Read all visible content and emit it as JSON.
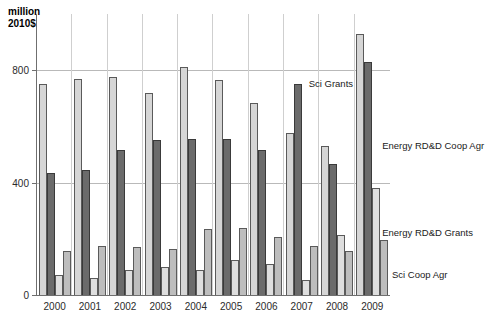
{
  "chart_data": {
    "type": "bar",
    "title": "",
    "subtitle": "",
    "axis_title": "million\n2010$",
    "xlabel": "",
    "ylabel": "million 2010$",
    "ylim": [
      0,
      1000
    ],
    "yticks": [
      0,
      400,
      800
    ],
    "ytick_labels": [
      "0",
      "400",
      "800"
    ],
    "grid": true,
    "legend_position": "inline-right",
    "categories": [
      "2000",
      "2001",
      "2002",
      "2003",
      "2004",
      "2005",
      "2006",
      "2007",
      "2008",
      "2009"
    ],
    "series": [
      {
        "name": "Sci Grants",
        "color": "#d6d6d6",
        "values": [
          750,
          770,
          775,
          720,
          810,
          765,
          685,
          575,
          530,
          930
        ]
      },
      {
        "name": "Energy RD&D Coop Agr",
        "color": "#6b6b6b",
        "values": [
          435,
          445,
          515,
          550,
          555,
          555,
          515,
          750,
          465,
          830
        ]
      },
      {
        "name": "Energy RD&D Grants",
        "color": "#dedede",
        "values": [
          70,
          60,
          90,
          100,
          90,
          125,
          110,
          55,
          215,
          380
        ]
      },
      {
        "name": "Sci Coop Agr",
        "color": "#bdbdbd",
        "values": [
          155,
          175,
          170,
          165,
          235,
          240,
          205,
          175,
          155,
          195
        ]
      }
    ],
    "annotations": [
      {
        "text": "Sci Grants",
        "x_pct": 63.0,
        "y_px": 78
      },
      {
        "text": "Energy RD&D Coop Agr",
        "x_pct": 78.0,
        "y_px": 140
      },
      {
        "text": "Energy RD&D Grants",
        "x_pct": 78.0,
        "y_px": 227
      },
      {
        "text": "Sci Coop Agr",
        "x_pct": 80.0,
        "y_px": 269
      }
    ]
  }
}
